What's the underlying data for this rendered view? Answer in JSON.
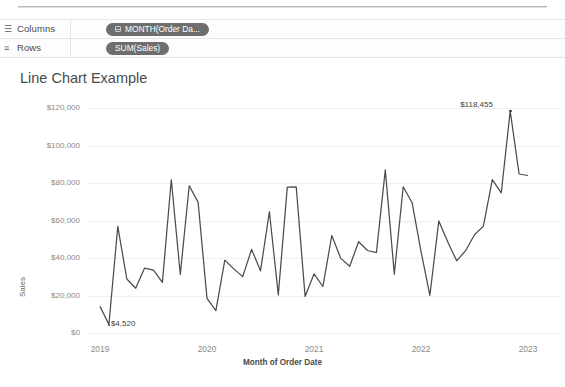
{
  "shelves": {
    "columns": {
      "label": "Columns",
      "icon": "columns-icon",
      "pill": "MONTH(Order Da...",
      "pill_icon": "calendar-icon"
    },
    "rows": {
      "label": "Rows",
      "icon": "rows-icon",
      "pill": "SUM(Sales)"
    },
    "pill_color": "#6e6e6e"
  },
  "chart_data": {
    "type": "line",
    "title": "Line Chart Example",
    "xlabel": "Month of Order Date",
    "ylabel": "Sales",
    "ylim": [
      0,
      120000
    ],
    "ytick_labels": [
      "$0",
      "$20,000",
      "$40,000",
      "$60,000",
      "$80,000",
      "$100,000",
      "$120,000"
    ],
    "ytick_values": [
      0,
      20000,
      40000,
      60000,
      80000,
      100000,
      120000
    ],
    "xtick_labels": [
      "2019",
      "2020",
      "2021",
      "2022",
      "2023"
    ],
    "grid": true,
    "legend": "none",
    "line_color": "#4c4c4c",
    "annotations": [
      {
        "name": "minimum-label",
        "text": "$4,520",
        "x": "2019-02",
        "y": 4520
      },
      {
        "name": "maximum-label",
        "text": "$118,455",
        "x": "2022-11",
        "y": 118455
      }
    ],
    "x": [
      "2019-01",
      "2019-02",
      "2019-03",
      "2019-04",
      "2019-05",
      "2019-06",
      "2019-07",
      "2019-08",
      "2019-09",
      "2019-10",
      "2019-11",
      "2019-12",
      "2020-01",
      "2020-02",
      "2020-03",
      "2020-04",
      "2020-05",
      "2020-06",
      "2020-07",
      "2020-08",
      "2020-09",
      "2020-10",
      "2020-11",
      "2020-12",
      "2021-01",
      "2021-02",
      "2021-03",
      "2021-04",
      "2021-05",
      "2021-06",
      "2021-07",
      "2021-08",
      "2021-09",
      "2021-10",
      "2021-11",
      "2021-12",
      "2022-01",
      "2022-02",
      "2022-03",
      "2022-04",
      "2022-05",
      "2022-06",
      "2022-07",
      "2022-08",
      "2022-09",
      "2022-10",
      "2022-11",
      "2022-12",
      "2023-01"
    ],
    "values": [
      14200,
      4520,
      56900,
      28800,
      23900,
      34600,
      33500,
      27000,
      81700,
      31200,
      78500,
      69800,
      18500,
      11900,
      38900,
      34200,
      30100,
      44600,
      33200,
      64700,
      20300,
      77800,
      78000,
      19500,
      31500,
      24800,
      52000,
      39800,
      35600,
      48700,
      44000,
      42900,
      87000,
      31400,
      78000,
      69500,
      43500,
      20100,
      59800,
      48500,
      38500,
      43900,
      52400,
      57000,
      81800,
      74800,
      118455,
      84800,
      84000
    ]
  }
}
